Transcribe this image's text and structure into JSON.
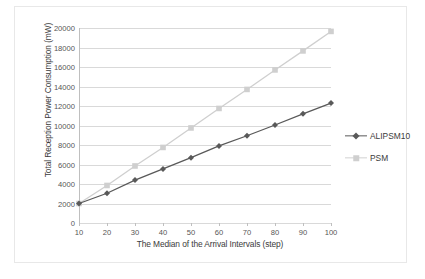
{
  "chart_data": {
    "type": "line",
    "title": "",
    "xlabel": "The Median of the Arrival Intervals (step)",
    "ylabel": "Total Reception Power Consumption (mW)",
    "x": [
      10,
      20,
      30,
      40,
      50,
      60,
      70,
      80,
      90,
      100
    ],
    "xtick_labels": [
      "10",
      "20",
      "30",
      "40",
      "50",
      "60",
      "70",
      "80",
      "90",
      "100"
    ],
    "ytick_labels": [
      "0",
      "2000",
      "4000",
      "6000",
      "8000",
      "10000",
      "12000",
      "14000",
      "16000",
      "18000",
      "20000"
    ],
    "yticks": [
      0,
      2000,
      4000,
      6000,
      8000,
      10000,
      12000,
      14000,
      16000,
      18000,
      20000
    ],
    "xlim": [
      10,
      100
    ],
    "ylim": [
      0,
      20000
    ],
    "grid": "horizontal",
    "legend_position": "right",
    "series": [
      {
        "name": "ALIPSM10",
        "color": "#595959",
        "marker": "diamond",
        "values": [
          2000,
          3050,
          4400,
          5550,
          6700,
          7900,
          8950,
          10050,
          11200,
          12300
        ]
      },
      {
        "name": "PSM",
        "color": "#cfcfcf",
        "marker": "square",
        "values": [
          2000,
          3850,
          5850,
          7750,
          9750,
          11750,
          13700,
          15700,
          17650,
          19650
        ]
      }
    ]
  },
  "legend": {
    "items": [
      {
        "label": "ALIPSM10"
      },
      {
        "label": "PSM"
      }
    ]
  },
  "colors": {
    "gridline": "#d9d9d9",
    "axis": "#bfbfbf",
    "text": "#3b3b3b",
    "frame": "#e8e8e8"
  }
}
